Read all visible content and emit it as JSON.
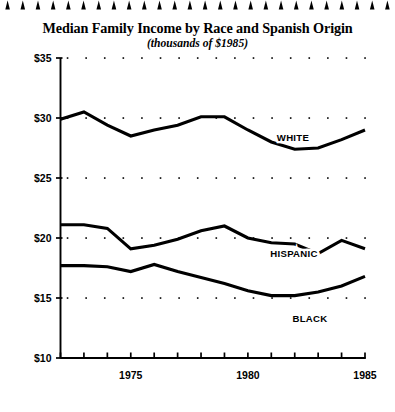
{
  "decor": {
    "top_border_icon": "triangle-spike-border",
    "triangle_count": 26
  },
  "chart_data": {
    "type": "line",
    "title": "Median Family Income by Race and Spanish Origin",
    "subtitle": "(thousands of $1985)",
    "xlabel": "",
    "ylabel": "",
    "grid": "dotted-horizontal",
    "legend": "inline-series-labels",
    "xlim": [
      1972,
      1985
    ],
    "ylim": [
      10,
      35
    ],
    "ytick_labels": [
      "$35",
      "$30",
      "$25",
      "$20",
      "$15",
      "$10"
    ],
    "ytick_values": [
      35,
      30,
      25,
      20,
      15,
      10
    ],
    "xtick_values": [
      1972,
      1973,
      1974,
      1975,
      1976,
      1977,
      1978,
      1979,
      1980,
      1981,
      1982,
      1983,
      1984,
      1985
    ],
    "xtick_labels": [
      "",
      "",
      "",
      "1975",
      "",
      "",
      "",
      "",
      "1980",
      "",
      "",
      "",
      "",
      "1985"
    ],
    "x": [
      1972,
      1973,
      1974,
      1975,
      1976,
      1977,
      1978,
      1979,
      1980,
      1981,
      1982,
      1983,
      1984,
      1985
    ],
    "series": [
      {
        "name": "WHITE",
        "label": "WHITE",
        "color": "#000000",
        "values": [
          29.9,
          30.5,
          29.4,
          28.5,
          29.0,
          29.4,
          30.1,
          30.1,
          29.0,
          28.0,
          27.4,
          27.5,
          28.2,
          29.0
        ]
      },
      {
        "name": "HISPANIC",
        "label": "HISPANIC",
        "color": "#000000",
        "values": [
          21.1,
          21.1,
          20.8,
          19.1,
          19.4,
          19.9,
          20.6,
          21.0,
          20.0,
          19.6,
          19.5,
          18.7,
          19.8,
          19.1
        ]
      },
      {
        "name": "BLACK",
        "label": "BLACK",
        "color": "#000000",
        "values": [
          17.7,
          17.7,
          17.6,
          17.2,
          17.8,
          17.2,
          16.7,
          16.2,
          15.6,
          15.2,
          15.2,
          15.5,
          16.0,
          16.8
        ]
      }
    ],
    "series_label_positions": [
      {
        "name": "WHITE",
        "x": 293,
        "y": 141
      },
      {
        "name": "HISPANIC",
        "x": 294,
        "y": 257
      },
      {
        "name": "BLACK",
        "x": 310,
        "y": 322
      }
    ]
  },
  "colors": {
    "background": "#ffffff",
    "ink": "#000000",
    "grid_dot": "#000000"
  }
}
